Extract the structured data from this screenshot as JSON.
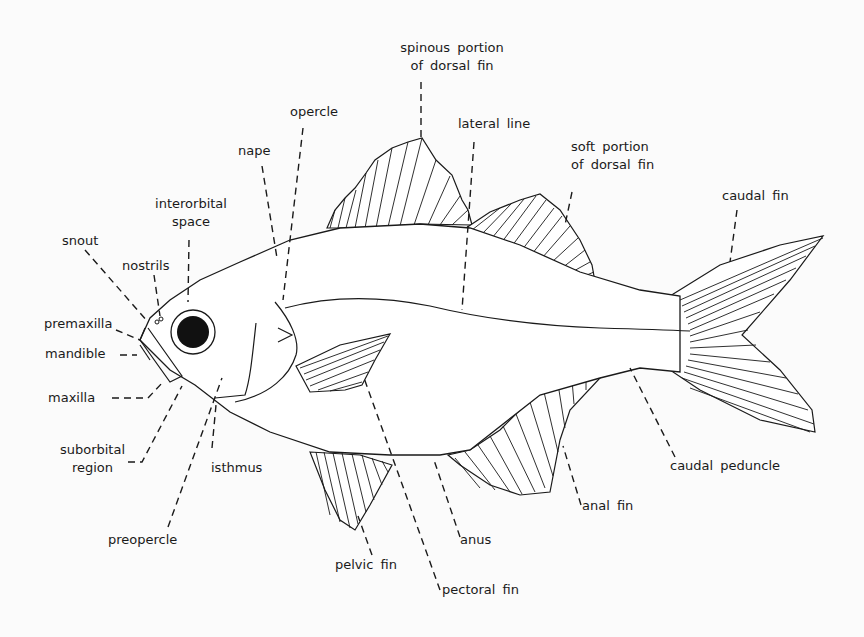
{
  "diagram": {
    "colors": {
      "ink": "#1a1a1a",
      "background": "#fbfbfb"
    },
    "labels": {
      "spinous_dorsal_1": "spinous portion",
      "spinous_dorsal_2": "of dorsal fin",
      "lateral_line": "lateral line",
      "soft_dorsal_1": "soft portion",
      "soft_dorsal_2": "of dorsal fin",
      "caudal_fin": "caudal fin",
      "opercle": "opercle",
      "nape": "nape",
      "interorbital_1": "interorbital",
      "interorbital_2": "space",
      "snout": "snout",
      "nostrils": "nostrils",
      "premaxilla": "premaxilla",
      "mandible": "mandible",
      "maxilla": "maxilla",
      "suborbital_1": "suborbital",
      "suborbital_2": "region",
      "isthmus": "isthmus",
      "preopercle": "preopercle",
      "pelvic_fin": "pelvic fin",
      "pectoral_fin": "pectoral fin",
      "anus": "anus",
      "anal_fin": "anal fin",
      "caudal_peduncle": "caudal peduncle"
    }
  }
}
